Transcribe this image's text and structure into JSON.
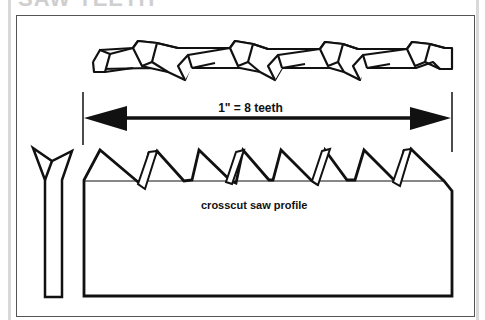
{
  "figure": {
    "title_partial": "SAW TEETH",
    "dimension_label": "1\" = 8 teeth",
    "profile_caption": "crosscut saw profile",
    "teeth_per_inch": 8,
    "views": [
      {
        "name": "top view of tooth set (alternating bevel)"
      },
      {
        "name": "dimension arrow spanning 1 inch"
      },
      {
        "name": "end view of blade showing set"
      },
      {
        "name": "side profile of crosscut saw teeth"
      }
    ],
    "colors": {
      "line": "#111111",
      "frame": "#555555",
      "background": "#ffffff"
    }
  }
}
